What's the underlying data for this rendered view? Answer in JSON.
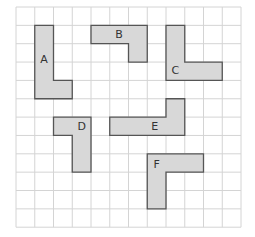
{
  "grid": {
    "columns": 12,
    "rows": 12,
    "line_color": "#d4d4d4"
  },
  "shape_style": {
    "fill": "#d8d8d8",
    "stroke": "#555555"
  },
  "shapes": [
    {
      "label": "A",
      "cells_outline": [
        [
          1,
          1
        ],
        [
          2,
          1
        ],
        [
          2,
          4
        ],
        [
          3,
          4
        ],
        [
          3,
          5
        ],
        [
          1,
          5
        ]
      ],
      "label_at": [
        1.5,
        2.9
      ]
    },
    {
      "label": "B",
      "cells_outline": [
        [
          4,
          1
        ],
        [
          7,
          1
        ],
        [
          7,
          3
        ],
        [
          6,
          3
        ],
        [
          6,
          2
        ],
        [
          4,
          2
        ]
      ],
      "label_at": [
        5.5,
        1.5
      ]
    },
    {
      "label": "C",
      "cells_outline": [
        [
          8,
          1
        ],
        [
          9,
          1
        ],
        [
          9,
          3
        ],
        [
          11,
          3
        ],
        [
          11,
          4
        ],
        [
          8,
          4
        ]
      ],
      "label_at": [
        8.5,
        3.5
      ]
    },
    {
      "label": "D",
      "cells_outline": [
        [
          2,
          6
        ],
        [
          4,
          6
        ],
        [
          4,
          9
        ],
        [
          3,
          9
        ],
        [
          3,
          7
        ],
        [
          2,
          7
        ]
      ],
      "label_at": [
        3.5,
        6.55
      ]
    },
    {
      "label": "E",
      "cells_outline": [
        [
          5,
          6
        ],
        [
          8,
          6
        ],
        [
          8,
          5
        ],
        [
          9,
          5
        ],
        [
          9,
          7
        ],
        [
          5,
          7
        ]
      ],
      "label_at": [
        7.4,
        6.55
      ]
    },
    {
      "label": "F",
      "cells_outline": [
        [
          7,
          8
        ],
        [
          10,
          8
        ],
        [
          10,
          9
        ],
        [
          8,
          9
        ],
        [
          8,
          11
        ],
        [
          7,
          11
        ]
      ],
      "label_at": [
        7.5,
        8.6
      ]
    }
  ]
}
